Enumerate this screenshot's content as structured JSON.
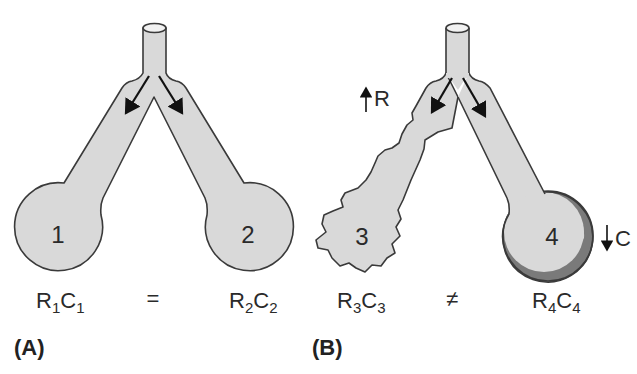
{
  "figure": {
    "panel_a": {
      "label": "(A)",
      "units": [
        {
          "number": "1",
          "expr": {
            "R": "R",
            "r_sub": "1",
            "C": "C",
            "c_sub": "1"
          }
        },
        {
          "number": "2",
          "expr": {
            "R": "R",
            "r_sub": "2",
            "C": "C",
            "c_sub": "2"
          }
        }
      ],
      "relation": "="
    },
    "panel_b": {
      "label": "(B)",
      "units": [
        {
          "number": "3",
          "expr": {
            "R": "R",
            "r_sub": "3",
            "C": "C",
            "c_sub": "3"
          }
        },
        {
          "number": "4",
          "expr": {
            "R": "R",
            "r_sub": "4",
            "C": "C",
            "c_sub": "4"
          }
        }
      ],
      "relation": "≠",
      "annotations": {
        "resistance": {
          "arrow": "up",
          "text": "R"
        },
        "compliance": {
          "arrow": "down",
          "text": "C"
        }
      }
    },
    "colors": {
      "airway_fill": "#d9d9d9",
      "outline": "#3a3a3a",
      "stiff_wall": "#7a7a7a",
      "arrow": "#111111"
    }
  }
}
